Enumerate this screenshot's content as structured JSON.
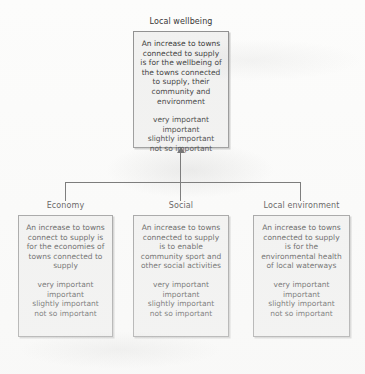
{
  "diagram": {
    "type": "tree",
    "root": {
      "title": "Local wellbeing",
      "statement": "An increase to towns connected to supply is for the wellbeing of the towns connected to supply, their community and environment",
      "scale": [
        "very important",
        "important",
        "slightly important",
        "not so important"
      ]
    },
    "children": [
      {
        "title": "Economy",
        "statement": "An increase to towns connect to supply is for the economies of towns connected to supply",
        "scale": [
          "very important",
          "important",
          "slightly important",
          "not so important"
        ]
      },
      {
        "title": "Social",
        "statement": "An increase to towns connected to supply is to enable community sport and other social activities",
        "scale": [
          "very important",
          "important",
          "slightly important",
          "not so important"
        ]
      },
      {
        "title": "Local environment",
        "statement": "An increase to towns connected to supply is for the environmental health of local waterways",
        "scale": [
          "very important",
          "important",
          "slightly important",
          "not so important"
        ]
      }
    ],
    "connectors": {
      "arrow_direction": "children-to-root",
      "line_color": "#555555"
    },
    "colors": {
      "box_fill": "#f1f1f0",
      "box_border": "#8d8d8d",
      "page_background": "#fcfcfb",
      "text": "#2e2e2e"
    }
  }
}
